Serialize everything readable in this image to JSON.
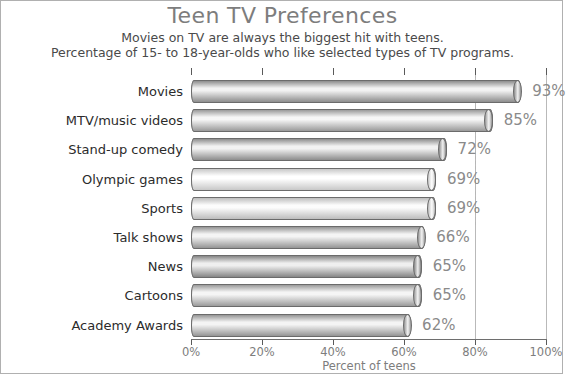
{
  "chart_data": {
    "type": "bar",
    "orientation": "horizontal",
    "title": "Teen TV Preferences",
    "subtitle_1": "Movies on TV are always the biggest hit with teens.",
    "subtitle_2": "Percentage of 15- to 18-year-olds who like selected types of TV programs.",
    "xlabel": "Percent of teens",
    "ylabel": "",
    "categories": [
      "Movies",
      "MTV/music videos",
      "Stand-up comedy",
      "Olympic games",
      "Sports",
      "Talk shows",
      "News",
      "Cartoons",
      "Academy Awards"
    ],
    "values": [
      93,
      85,
      72,
      69,
      69,
      66,
      65,
      65,
      62
    ],
    "value_labels": [
      "93%",
      "85%",
      "72%",
      "69%",
      "69%",
      "66%",
      "65%",
      "65%",
      "62%"
    ],
    "xlim": [
      0,
      100
    ],
    "xticks": [
      0,
      20,
      40,
      60,
      80,
      100
    ],
    "xtick_labels": [
      "0%",
      "20%",
      "40%",
      "60%",
      "80%",
      "100%"
    ],
    "grid": true,
    "gridlines_at": [
      80,
      100
    ],
    "legend": null,
    "bar_style": "3d-cylinder-grayscale",
    "bar_shades": [
      {
        "category": "Movies",
        "mid": "#f2f2f2",
        "edge": "#8d8d8d"
      },
      {
        "category": "MTV/music videos",
        "mid": "#f6f6f6",
        "edge": "#9a9a9a"
      },
      {
        "category": "Stand-up comedy",
        "mid": "#f2f2f2",
        "edge": "#8d8d8d"
      },
      {
        "category": "Olympic games",
        "mid": "#ffffff",
        "edge": "#c8c8c8"
      },
      {
        "category": "Sports",
        "mid": "#fcfcfc",
        "edge": "#bdbdbd"
      },
      {
        "category": "Talk shows",
        "mid": "#f4f4f4",
        "edge": "#949494"
      },
      {
        "category": "News",
        "mid": "#efefef",
        "edge": "#868686"
      },
      {
        "category": "Cartoons",
        "mid": "#f5f5f5",
        "edge": "#9b9b9b"
      },
      {
        "category": "Academy Awards",
        "mid": "#f4f4f4",
        "edge": "#959595"
      }
    ]
  },
  "colors": {
    "title": "#7d7d7d",
    "subtitle": "#4a4a4a",
    "category_label": "#2b2b2b",
    "value_label": "#8a8a8a",
    "tick_label": "#7d7d7d",
    "axis": "#6e6e6e",
    "gridline": "#b9b9b9",
    "frame_border": "#b0b0b0"
  }
}
